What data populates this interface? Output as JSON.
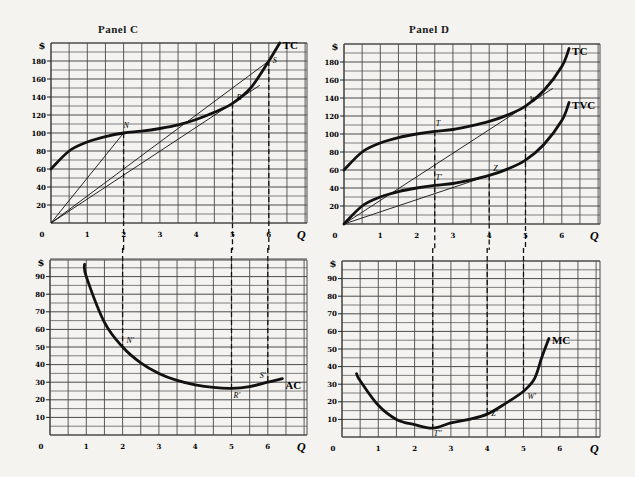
{
  "panels": {
    "top_left_title": "Panel C",
    "top_right_title": "Panel D"
  },
  "axis": {
    "y_unit": "$",
    "x_label": "Q",
    "origin": "0",
    "x_ticks": [
      "1",
      "2",
      "3",
      "4",
      "5",
      "6"
    ],
    "top_y_ticks": [
      "20",
      "40",
      "60",
      "80",
      "100",
      "120",
      "140",
      "160",
      "180"
    ],
    "bottom_y_ticks": [
      "10",
      "20",
      "30",
      "40",
      "50",
      "60",
      "70",
      "80",
      "90"
    ]
  },
  "labels": {
    "tc": "TC",
    "tvc": "TVC",
    "ac": "AC",
    "mc": "MC",
    "N": "N",
    "R": "R",
    "S": "S",
    "N_prime": "N′",
    "R_prime": "R′",
    "S_prime": "S′",
    "T": "T",
    "T_prime": "T′",
    "W": "W",
    "Z": "Z",
    "T_dprime": "T″",
    "W_prime": "W′",
    "Z_prime": "Z′"
  },
  "chart_data": [
    {
      "type": "line",
      "title": "Panel C (top)",
      "xlabel": "Q",
      "ylabel": "$",
      "xlim": [
        0,
        7
      ],
      "ylim": [
        0,
        200
      ],
      "grid": true,
      "series": [
        {
          "name": "TC",
          "x": [
            0,
            0.5,
            1,
            1.5,
            2,
            2.5,
            3,
            3.5,
            4,
            4.5,
            5,
            5.5,
            6,
            6.3
          ],
          "values": [
            60,
            80,
            90,
            96,
            100,
            102,
            105,
            109,
            115,
            123,
            133,
            150,
            180,
            200
          ]
        }
      ],
      "rays_from_origin": [
        {
          "to_point": "N",
          "x": 2,
          "y": 100
        },
        {
          "to_point": "S",
          "x": 6,
          "y": 180
        },
        {
          "to_point": "R",
          "x": 5,
          "y": 133,
          "tangent": true
        }
      ],
      "points": [
        {
          "label": "N",
          "x": 2,
          "y": 100
        },
        {
          "label": "R",
          "x": 5,
          "y": 133
        },
        {
          "label": "S",
          "x": 6,
          "y": 180
        }
      ],
      "dashed_verticals": [
        2,
        5,
        6
      ]
    },
    {
      "type": "line",
      "title": "Panel D (top)",
      "xlabel": "Q",
      "ylabel": "$",
      "xlim": [
        0,
        7
      ],
      "ylim": [
        0,
        200
      ],
      "grid": true,
      "series": [
        {
          "name": "TC",
          "x": [
            0,
            0.5,
            1,
            1.5,
            2,
            2.5,
            3,
            3.5,
            4,
            4.5,
            5,
            5.5,
            6,
            6.2
          ],
          "values": [
            60,
            80,
            90,
            96,
            100,
            103,
            105,
            109,
            114,
            121,
            131,
            148,
            175,
            195
          ]
        },
        {
          "name": "TVC",
          "x": [
            0,
            0.5,
            1,
            1.5,
            2,
            2.5,
            3,
            3.5,
            4,
            4.5,
            5,
            5.5,
            6,
            6.2
          ],
          "values": [
            0,
            20,
            30,
            36,
            40,
            43,
            45,
            49,
            54,
            61,
            71,
            88,
            115,
            135
          ]
        }
      ],
      "rays_from_origin": [
        {
          "to_point": "W",
          "x": 5,
          "y": 131,
          "tangent_to": "TC"
        },
        {
          "to_point": "Z",
          "x": 4,
          "y": 54,
          "tangent_to": "TVC"
        }
      ],
      "points": [
        {
          "label": "T",
          "x": 2.5,
          "y": 103
        },
        {
          "label": "T′",
          "x": 2.5,
          "y": 43
        },
        {
          "label": "W",
          "x": 5,
          "y": 131
        },
        {
          "label": "Z",
          "x": 4,
          "y": 54
        }
      ],
      "dashed_verticals": [
        2.5,
        4,
        5
      ]
    },
    {
      "type": "line",
      "title": "Panel C (bottom)",
      "xlabel": "Q",
      "ylabel": "$",
      "xlim": [
        0,
        7
      ],
      "ylim": [
        0,
        100
      ],
      "grid": true,
      "series": [
        {
          "name": "AC",
          "x": [
            0.95,
            1,
            1.5,
            2,
            2.5,
            3,
            3.5,
            4,
            4.5,
            5,
            5.5,
            6,
            6.4
          ],
          "values": [
            97,
            90,
            64,
            50,
            41,
            35,
            31,
            28.5,
            27,
            26.5,
            27.5,
            30,
            32
          ]
        }
      ],
      "points": [
        {
          "label": "N′",
          "x": 2,
          "y": 50
        },
        {
          "label": "R′",
          "x": 5,
          "y": 26.5
        },
        {
          "label": "S′",
          "x": 6,
          "y": 30
        }
      ],
      "dashed_verticals": [
        2,
        5,
        6
      ]
    },
    {
      "type": "line",
      "title": "Panel D (bottom)",
      "xlabel": "Q",
      "ylabel": "$",
      "xlim": [
        0,
        7
      ],
      "ylim": [
        0,
        100
      ],
      "grid": true,
      "series": [
        {
          "name": "MC",
          "x": [
            0.4,
            0.5,
            1,
            1.5,
            2,
            2.5,
            3,
            3.5,
            4,
            4.5,
            5,
            5.3,
            5.5,
            5.7
          ],
          "values": [
            36,
            32,
            18,
            10,
            7,
            5,
            8,
            10,
            13,
            19,
            26,
            33,
            45,
            56
          ]
        }
      ],
      "points": [
        {
          "label": "T″",
          "x": 2.5,
          "y": 5
        },
        {
          "label": "Z′",
          "x": 4,
          "y": 13
        },
        {
          "label": "W′",
          "x": 5,
          "y": 26
        }
      ],
      "dashed_verticals": [
        2.5,
        4,
        5
      ]
    }
  ]
}
